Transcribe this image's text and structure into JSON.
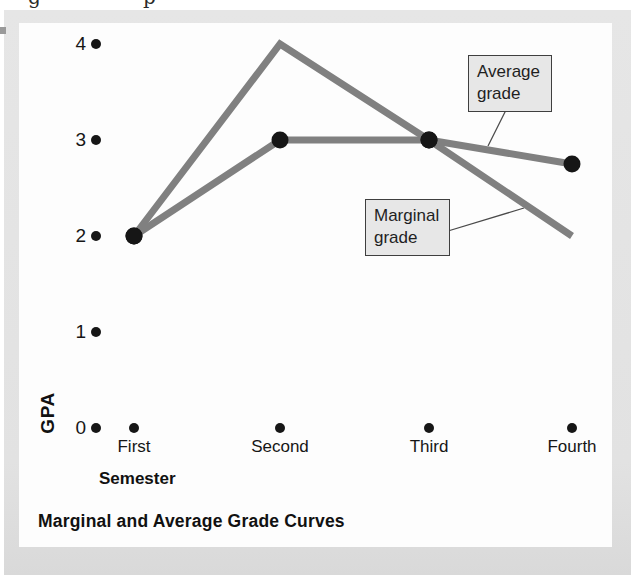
{
  "page": {
    "cropped_fragments": [
      "g",
      "p"
    ]
  },
  "chart_data": {
    "type": "line",
    "title": "Marginal and Average Grade Curves",
    "xlabel": "Semester",
    "ylabel": "GPA",
    "categories": [
      "First",
      "Second",
      "Third",
      "Fourth"
    ],
    "y_ticks": [
      0,
      1,
      2,
      3,
      4
    ],
    "ylim": [
      0,
      4
    ],
    "grid": false,
    "legend_position": "callout-boxes",
    "series": [
      {
        "name": "Marginal grade",
        "values": [
          2,
          4,
          3,
          2
        ],
        "marker_indices": [
          0,
          2
        ]
      },
      {
        "name": "Average grade",
        "values": [
          2,
          3,
          3,
          2.75
        ],
        "marker_indices": [
          0,
          1,
          2,
          3
        ]
      }
    ],
    "annotations": [
      {
        "label": "Average grade",
        "series": "Average grade"
      },
      {
        "label": "Marginal grade",
        "series": "Marginal grade"
      }
    ],
    "colors": {
      "line": "#808080",
      "marker": "#161616",
      "panel": "#e3e3e3",
      "callout_fill": "#e7e7e7",
      "callout_border": "#3f3f3f"
    }
  }
}
